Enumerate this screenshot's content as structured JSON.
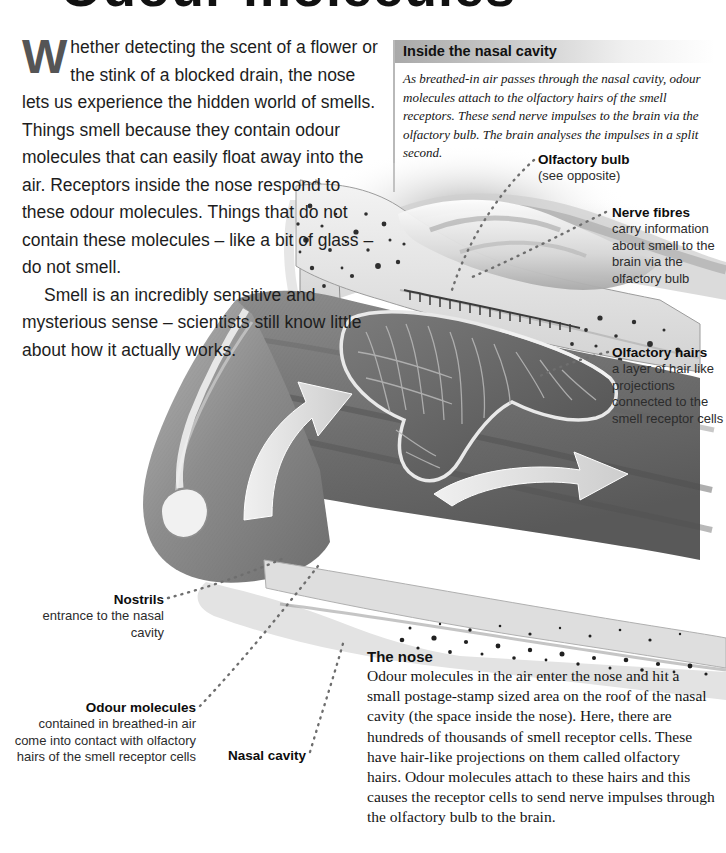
{
  "page": {
    "title": "Odour molecules",
    "background_color": "#ffffff"
  },
  "intro": {
    "dropcap": "W",
    "paragraph_1": "hether detecting the scent of a flower or the stink of a blocked drain, the nose lets us experience the hidden world of smells. Things smell because they contain odour molecules that can easily float away into the air. Receptors inside the nose respond to these odour molecules. Things that do not contain these molecules – like a bit of glass – do not smell.",
    "paragraph_2": "Smell is an incredibly sensitive and mysterious sense – scientists still know little about how it actually works."
  },
  "infobox": {
    "heading": "Inside the nasal cavity",
    "body": "As breathed-in air passes through the nasal cavity, odour molecules attach to the olfactory hairs of the smell receptors. These send nerve impulses to the brain via the olfactory bulb. The brain analyses the impulses in a split second.",
    "header_gradient_from": "#a9a9a9",
    "header_gradient_to": "#ffffff"
  },
  "labels": {
    "olfactory_bulb": {
      "title": "Olfactory bulb",
      "subtitle": "(see opposite)"
    },
    "nerve_fibres": {
      "title": "Nerve fibres",
      "subtitle": "carry information about smell to the brain via the olfactory bulb"
    },
    "olfactory_hairs": {
      "title": "Olfactory hairs",
      "subtitle": "a layer of hair like projections connected to the smell receptor cells"
    },
    "nostrils": {
      "title": "Nostrils",
      "subtitle": "entrance to the nasal cavity"
    },
    "odour_molecules": {
      "title": "Odour molecules",
      "subtitle": "contained in breathed-in air come into contact with olfactory hairs of the smell receptor cells"
    },
    "nasal_cavity": {
      "title": "Nasal cavity"
    }
  },
  "nose_section": {
    "heading": "The nose",
    "body": "Odour molecules in the air enter the nose and hit a small postage-stamp sized area on the roof of the nasal cavity (the space inside the nose). Here, there are hundreds of thousands of smell receptor cells. These have hair-like projections on them called olfactory hairs. Odour molecules attach to these hairs and this causes the receptor cells to send nerve impulses through the olfactory bulb to the brain."
  },
  "illustration": {
    "name": "nasal-cavity-cross-section",
    "description": "Greyscale medical cross-section of a human nose showing nasal cavity, turbinates, olfactory bulb, bone and airflow arrows",
    "airflow_arrows": 2,
    "tone_dark": "#6a6a6a",
    "tone_mid": "#9a9a9a",
    "tone_light": "#e8e8e8"
  }
}
